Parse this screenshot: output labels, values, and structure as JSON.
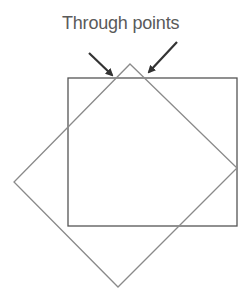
{
  "diagram": {
    "label": "Through points",
    "colors": {
      "background": "#ffffff",
      "text": "#5a5a5a",
      "rectangle_stroke": "#555555",
      "diamond_stroke": "#8a8a8a",
      "arrow": "#333333"
    },
    "shapes": [
      {
        "type": "rectangle",
        "name": "axis-aligned square",
        "x": 68,
        "y": 78,
        "width": 169,
        "height": 148
      },
      {
        "type": "polygon",
        "name": "rotated square",
        "points": [
          [
            130,
            64
          ],
          [
            237,
            168
          ],
          [
            118,
            287
          ],
          [
            14,
            182
          ]
        ]
      }
    ],
    "arrows": [
      {
        "name": "left arrow",
        "from": [
          89,
          53
        ],
        "to": [
          114,
          77
        ]
      },
      {
        "name": "right arrow",
        "from": [
          177,
          42
        ],
        "to": [
          147,
          74
        ]
      }
    ]
  }
}
